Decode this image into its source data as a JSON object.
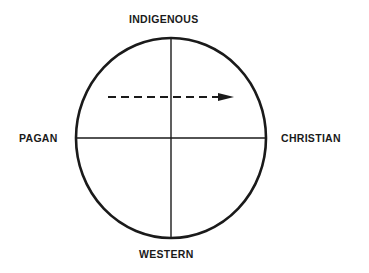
{
  "diagram": {
    "axes": {
      "top": "INDIGENOUS",
      "bottom": "WESTERN",
      "left": "PAGAN",
      "right": "CHRISTIAN"
    },
    "arrow": {
      "style": "dashed",
      "direction": "left-to-right",
      "quadrant_row": "upper"
    },
    "colors": {
      "stroke": "#1a1a1a",
      "background": "#ffffff"
    }
  }
}
